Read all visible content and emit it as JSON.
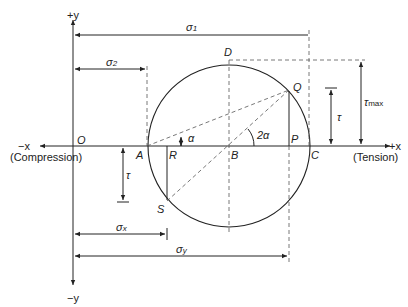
{
  "diagram": {
    "axes": {
      "pos_y": "+y",
      "neg_y": "−y",
      "pos_x": "+x",
      "neg_x": "−x",
      "origin": "O",
      "left_region": "(Compression)",
      "right_region": "(Tension)"
    },
    "points": {
      "A": "A",
      "B": "B",
      "C": "C",
      "D": "D",
      "P": "P",
      "Q": "Q",
      "R": "R",
      "S": "S"
    },
    "angles": {
      "alpha": "α",
      "two_alpha": "2α"
    },
    "dimensions": {
      "sigma1": {
        "sym": "σ",
        "sub": "1"
      },
      "sigma2": {
        "sym": "σ",
        "sub": "2"
      },
      "sigmax": {
        "sym": "σ",
        "sub": "x"
      },
      "sigmay": {
        "sym": "σ",
        "sub": "y"
      },
      "tau_upper": "τ",
      "tau_lower": "τ",
      "tau_max": {
        "sym": "τ",
        "sub": "max"
      }
    },
    "colors": {
      "line": "#222222",
      "dash": "#555555",
      "background": "#ffffff"
    }
  }
}
